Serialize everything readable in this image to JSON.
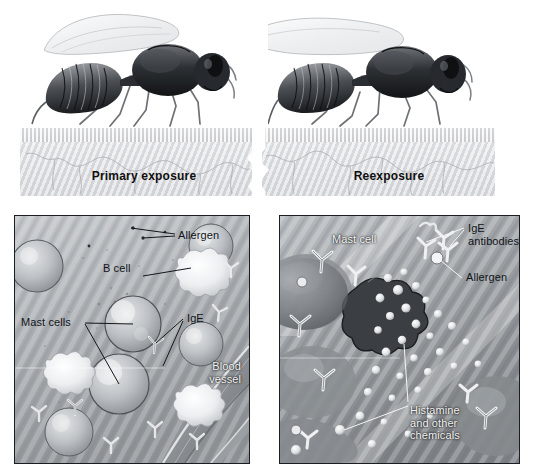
{
  "figure": {
    "background_color": "#ffffff",
    "label_color": "#111418",
    "light_label_color": "#f2f2f2",
    "panel_border_color": "#1a1d21"
  },
  "top": {
    "left_stage_label": "Primary exposure",
    "right_stage_label": "Reexposure",
    "insect_name": "wasp",
    "skin_surface_color": "#d9dadd",
    "dermis_color": "#dcdde0"
  },
  "panel_left": {
    "name": "primary-exposure-detail",
    "labels": [
      {
        "id": "allergen",
        "text": "Allergen"
      },
      {
        "id": "b-cell",
        "text": "B cell"
      },
      {
        "id": "mast-cells",
        "text": "Mast cells"
      },
      {
        "id": "ige",
        "text": "IgE"
      },
      {
        "id": "blood-vessel",
        "text": "Blood\nvessel"
      }
    ]
  },
  "panel_right": {
    "name": "reexposure-detail",
    "labels": [
      {
        "id": "mast-cell",
        "text": "Mast cell"
      },
      {
        "id": "ige-antibodies",
        "text": "IgE\nantibodies"
      },
      {
        "id": "allergen",
        "text": "Allergen"
      },
      {
        "id": "histamine",
        "text": "Histamine\nand other\nchemicals"
      }
    ]
  }
}
